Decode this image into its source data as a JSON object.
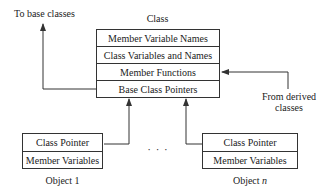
{
  "class_box": {
    "title": "Class",
    "rows": [
      "Member Variable Names",
      "Class Variables and Names",
      "Member Functions",
      "Base Class Pointers"
    ]
  },
  "labels": {
    "to_base": "To base classes",
    "from_derived_line1": "From derived",
    "from_derived_line2": "classes",
    "ellipsis": "· · ·"
  },
  "objects": [
    {
      "name": "Object 1",
      "rows": [
        "Class Pointer",
        "Member Variables"
      ]
    },
    {
      "name_prefix": "Object ",
      "name_italic": "n",
      "rows": [
        "Class Pointer",
        "Member Variables"
      ]
    }
  ],
  "colors": {
    "line": "#333333",
    "text": "#222222",
    "background": "#ffffff"
  }
}
